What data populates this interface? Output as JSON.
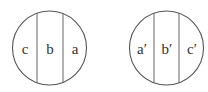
{
  "diagram": {
    "left_circle": {
      "segments": [
        "c",
        "b",
        "a"
      ]
    },
    "right_circle": {
      "segments": [
        "a′",
        "b′",
        "c′"
      ]
    },
    "stroke_color": "#555555"
  }
}
